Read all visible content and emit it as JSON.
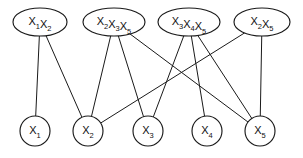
{
  "figure": {
    "type": "bipartite-graph",
    "title": "",
    "background_color": "#ffffff",
    "line_color": "#1a1a1a",
    "text_color": "#111111",
    "width": 303,
    "height": 158
  },
  "top_nodes": [
    {
      "id": "c1",
      "label": "X1X2",
      "variables": [
        "X1",
        "X2"
      ],
      "shape": "ellipse",
      "cx": 40,
      "cy": 22,
      "rx": 27,
      "ry": 14
    },
    {
      "id": "c2",
      "label": "X2X3X5",
      "variables": [
        "X2",
        "X3",
        "X5"
      ],
      "shape": "ellipse",
      "cx": 114,
      "cy": 22,
      "rx": 31,
      "ry": 14
    },
    {
      "id": "c3",
      "label": "X3X4X5",
      "variables": [
        "X3",
        "X4",
        "X5"
      ],
      "shape": "ellipse",
      "cx": 189,
      "cy": 22,
      "rx": 31,
      "ry": 14
    },
    {
      "id": "c4",
      "label": "X2X5",
      "variables": [
        "X2",
        "X5"
      ],
      "shape": "ellipse",
      "cx": 262,
      "cy": 22,
      "rx": 28,
      "ry": 14
    }
  ],
  "bottom_nodes": [
    {
      "id": "v1",
      "label": "X1",
      "shape": "circle",
      "cx": 35,
      "cy": 131,
      "r": 15
    },
    {
      "id": "v2",
      "label": "X2",
      "shape": "circle",
      "cx": 88,
      "cy": 131,
      "r": 15
    },
    {
      "id": "v3",
      "label": "X3",
      "shape": "circle",
      "cx": 148,
      "cy": 131,
      "r": 15
    },
    {
      "id": "v4",
      "label": "X4",
      "shape": "circle",
      "cx": 207,
      "cy": 131,
      "r": 15
    },
    {
      "id": "v5",
      "label": "X5",
      "shape": "circle",
      "cx": 260,
      "cy": 131,
      "r": 15
    }
  ],
  "edges": [
    {
      "from": "c1",
      "to": "v1"
    },
    {
      "from": "c1",
      "to": "v2"
    },
    {
      "from": "c2",
      "to": "v2"
    },
    {
      "from": "c2",
      "to": "v3"
    },
    {
      "from": "c2",
      "to": "v5"
    },
    {
      "from": "c3",
      "to": "v3"
    },
    {
      "from": "c3",
      "to": "v4"
    },
    {
      "from": "c3",
      "to": "v5"
    },
    {
      "from": "c4",
      "to": "v2"
    },
    {
      "from": "c4",
      "to": "v5"
    }
  ]
}
